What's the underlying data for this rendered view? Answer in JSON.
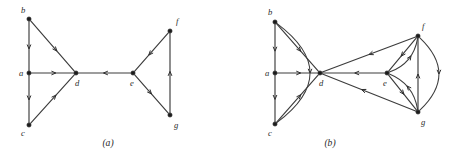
{
  "figure": {
    "background_color": "#ffffff",
    "ink_color": "#3c3c3c",
    "vertex_color": "#1c1c1c",
    "panels": [
      {
        "id": "panel-a",
        "caption": "(a)",
        "caption_pos": {
          "x": 108,
          "y": 146
        },
        "vertices": [
          {
            "id": "a",
            "label": "a",
            "x": 29,
            "y": 73,
            "label_x": 19,
            "label_y": 76
          },
          {
            "id": "b",
            "label": "b",
            "x": 29,
            "y": 19,
            "label_x": 21,
            "label_y": 13
          },
          {
            "id": "c",
            "label": "c",
            "x": 29,
            "y": 125,
            "label_x": 21,
            "label_y": 136
          },
          {
            "id": "d",
            "label": "d",
            "x": 76,
            "y": 73,
            "label_x": 75,
            "label_y": 86
          },
          {
            "id": "e",
            "label": "e",
            "x": 133,
            "y": 73,
            "label_x": 130,
            "label_y": 86
          },
          {
            "id": "f",
            "label": "f",
            "x": 170,
            "y": 31,
            "label_x": 176,
            "label_y": 24
          },
          {
            "id": "g",
            "label": "g",
            "x": 170,
            "y": 115,
            "label_x": 174,
            "label_y": 128
          }
        ],
        "edges": [
          {
            "id": "b-a",
            "from": "b",
            "to": "a",
            "kind": "straight",
            "arrow_t": 0.56
          },
          {
            "id": "a-c",
            "from": "a",
            "to": "c",
            "kind": "straight",
            "arrow_t": 0.52
          },
          {
            "id": "b-d",
            "from": "b",
            "to": "d",
            "kind": "straight",
            "arrow_t": 0.6
          },
          {
            "id": "a-d",
            "from": "a",
            "to": "d",
            "kind": "straight",
            "arrow_t": 0.58
          },
          {
            "id": "c-d",
            "from": "c",
            "to": "d",
            "kind": "straight",
            "arrow_t": 0.58
          },
          {
            "id": "e-d",
            "from": "e",
            "to": "d",
            "kind": "straight",
            "arrow_t": 0.52
          },
          {
            "id": "f-e",
            "from": "f",
            "to": "e",
            "kind": "straight",
            "arrow_t": 0.58
          },
          {
            "id": "e-g",
            "from": "e",
            "to": "g",
            "kind": "straight",
            "arrow_t": 0.5
          },
          {
            "id": "g-f",
            "from": "g",
            "to": "f",
            "kind": "straight",
            "arrow_t": 0.52
          }
        ]
      },
      {
        "id": "panel-b",
        "caption": "(b)",
        "caption_pos": {
          "x": 330,
          "y": 146
        },
        "vertices": [
          {
            "id": "a",
            "label": "a",
            "x": 275,
            "y": 73,
            "label_x": 265,
            "label_y": 76
          },
          {
            "id": "b",
            "label": "b",
            "x": 275,
            "y": 22,
            "label_x": 268,
            "label_y": 15
          },
          {
            "id": "c",
            "label": "c",
            "x": 275,
            "y": 124,
            "label_x": 268,
            "label_y": 136
          },
          {
            "id": "d",
            "label": "d",
            "x": 320,
            "y": 73,
            "label_x": 319,
            "label_y": 86
          },
          {
            "id": "e",
            "label": "e",
            "x": 387,
            "y": 73,
            "label_x": 383,
            "label_y": 86
          },
          {
            "id": "f",
            "label": "f",
            "x": 418,
            "y": 36,
            "label_x": 422,
            "label_y": 29
          },
          {
            "id": "g",
            "label": "g",
            "x": 418,
            "y": 112,
            "label_x": 421,
            "label_y": 125
          }
        ],
        "edges": [
          {
            "id": "b-a",
            "from": "b",
            "to": "a",
            "kind": "straight",
            "arrow_t": 0.58
          },
          {
            "id": "a-c",
            "from": "a",
            "to": "c",
            "kind": "straight",
            "arrow_t": 0.52
          },
          {
            "id": "b-c-curve",
            "from": "b",
            "to": "c",
            "kind": "curve",
            "bow": -34,
            "arrow_t": 0.5
          },
          {
            "id": "b-d",
            "from": "b",
            "to": "d",
            "kind": "straight",
            "arrow_t": 0.58
          },
          {
            "id": "a-d",
            "from": "a",
            "to": "d",
            "kind": "straight",
            "arrow_t": 0.58
          },
          {
            "id": "c-d",
            "from": "c",
            "to": "d",
            "kind": "straight",
            "arrow_t": 0.58
          },
          {
            "id": "e-d",
            "from": "e",
            "to": "d",
            "kind": "straight",
            "arrow_t": 0.48
          },
          {
            "id": "f-d",
            "from": "f",
            "to": "d",
            "kind": "straight",
            "arrow_t": 0.5
          },
          {
            "id": "g-d",
            "from": "g",
            "to": "d",
            "kind": "straight",
            "arrow_t": 0.58
          },
          {
            "id": "f-e",
            "from": "f",
            "to": "e",
            "kind": "straight",
            "arrow_t": 0.55
          },
          {
            "id": "e-f-curve",
            "from": "e",
            "to": "f",
            "kind": "curve",
            "bow": 7,
            "arrow_t": 0.6
          },
          {
            "id": "e-g",
            "from": "e",
            "to": "g",
            "kind": "straight",
            "arrow_t": 0.55
          },
          {
            "id": "g-e-curve",
            "from": "g",
            "to": "e",
            "kind": "curve",
            "bow": 7,
            "arrow_t": 0.55
          },
          {
            "id": "g-f",
            "from": "g",
            "to": "f",
            "kind": "straight",
            "arrow_t": 0.5
          },
          {
            "id": "f-g-curve",
            "from": "f",
            "to": "g",
            "kind": "curve",
            "bow": -20,
            "arrow_t": 0.5
          }
        ]
      }
    ]
  }
}
